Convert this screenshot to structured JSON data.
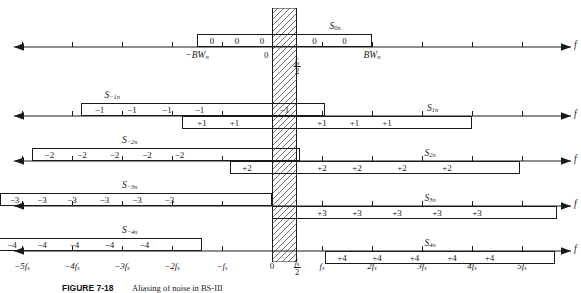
{
  "figure": {
    "caption_number": "FIGURE 7-18",
    "caption_text": "Aliasing of noise in BS-III",
    "axis_label": "f",
    "zero_label": "0",
    "half_fs_num": "f",
    "half_fs_sub": "s",
    "half_fs_den": "2"
  },
  "chart_data": {
    "type": "diagram",
    "xlabel": "f",
    "x_unit": "fs",
    "xlim": [
      -5.5,
      5.8
    ],
    "x_ticks": [
      {
        "value": -5,
        "label": "−5f",
        "sub": "s"
      },
      {
        "value": -4,
        "label": "−4f",
        "sub": "s"
      },
      {
        "value": -3,
        "label": "−3f",
        "sub": "s"
      },
      {
        "value": -2,
        "label": "−2f",
        "sub": "s"
      },
      {
        "value": -1,
        "label": "−f",
        "sub": "s"
      },
      {
        "value": 0,
        "label": "0",
        "sub": ""
      },
      {
        "value": 0.5,
        "label": "fs/2",
        "sub": ""
      },
      {
        "value": 1,
        "label": "f",
        "sub": "s"
      },
      {
        "value": 2,
        "label": "2f",
        "sub": "s"
      },
      {
        "value": 3,
        "label": "3f",
        "sub": "s"
      },
      {
        "value": 4,
        "label": "4f",
        "sub": "s"
      },
      {
        "value": 5,
        "label": "5f",
        "sub": "s"
      }
    ],
    "nyquist_band": {
      "from": 0,
      "to": 0.5,
      "fill": "hatch",
      "color": "#333333"
    },
    "rows": [
      {
        "row_index": 0,
        "left_marker": "−BW",
        "left_marker_sub": "n",
        "left_marker_x": -1.5,
        "right_marker": "BW",
        "right_marker_sub": "n",
        "right_marker_x": 2.0,
        "origin_label": "0",
        "bands": [
          {
            "name": "S",
            "sub": "0n",
            "label_x": 1.15,
            "from": -1.5,
            "to": 2.0,
            "side": "upper",
            "values": [
              "0",
              "0",
              "0",
              "0",
              "0"
            ],
            "value_x": [
              -1.2,
              -0.7,
              -0.2,
              0.85,
              1.45
            ]
          }
        ]
      },
      {
        "row_index": 1,
        "bands": [
          {
            "name": "S",
            "sub": "−1n",
            "label_x": -3.35,
            "from": -3.82,
            "to": 1.05,
            "side": "upper",
            "values": [
              "−1",
              "−1",
              "−1",
              "−1",
              "−1"
            ],
            "value_x": [
              -3.45,
              -2.8,
              -2.1,
              -1.45,
              0.25
            ]
          },
          {
            "name": "S",
            "sub": "1n",
            "label_x": 3.1,
            "from": -1.8,
            "to": 4.0,
            "side": "lower",
            "values": [
              "+1",
              "+1",
              "+1",
              "+1",
              "+1"
            ],
            "value_x": [
              -1.4,
              -0.75,
              1.0,
              1.65,
              2.3
            ]
          }
        ]
      },
      {
        "row_index": 2,
        "bands": [
          {
            "name": "S",
            "sub": "−2n",
            "label_x": -3.0,
            "from": -4.8,
            "to": 0.55,
            "side": "upper",
            "values": [
              "−2",
              "−2",
              "−2",
              "−2",
              "−2"
            ],
            "value_x": [
              -4.45,
              -3.8,
              -3.15,
              -2.5,
              -1.85
            ]
          },
          {
            "name": "S",
            "sub": "2n",
            "label_x": 3.05,
            "from": -0.85,
            "to": 4.95,
            "side": "lower",
            "values": [
              "+2",
              "+2",
              "+2",
              "+2",
              "+2"
            ],
            "value_x": [
              -0.5,
              1.0,
              1.7,
              2.6,
              3.5
            ]
          }
        ]
      },
      {
        "row_index": 3,
        "bands": [
          {
            "name": "S",
            "sub": "−3n",
            "label_x": -3.0,
            "from": -5.45,
            "to": 0.0,
            "side": "upper",
            "values": [
              "−3",
              "−3",
              "−3",
              "−3",
              "−3",
              "−3"
            ],
            "value_x": [
              -5.15,
              -4.6,
              -4.0,
              -3.35,
              -2.7,
              -2.05
            ]
          },
          {
            "name": "S",
            "sub": "3n",
            "label_x": 3.05,
            "from": 0.0,
            "to": 5.7,
            "side": "lower",
            "values": [
              "+3",
              "+3",
              "+3",
              "+3",
              "+3"
            ],
            "value_x": [
              1.0,
              1.7,
              2.5,
              3.3,
              4.1
            ]
          }
        ]
      },
      {
        "row_index": 4,
        "bands": [
          {
            "name": "S",
            "sub": "−4n",
            "label_x": -3.0,
            "from": -5.55,
            "to": -1.4,
            "side": "upper",
            "values": [
              "−4",
              "−4",
              "−4",
              "−4",
              "−4"
            ],
            "value_x": [
              -5.2,
              -4.6,
              -3.95,
              -3.25,
              -2.55
            ]
          },
          {
            "name": "S",
            "sub": "4n",
            "label_x": 3.05,
            "from": 1.05,
            "to": 5.65,
            "side": "lower",
            "values": [
              "+4",
              "+4",
              "+4",
              "+4",
              "+4"
            ],
            "value_x": [
              1.4,
              2.1,
              2.85,
              3.6,
              4.35
            ]
          }
        ]
      }
    ]
  }
}
